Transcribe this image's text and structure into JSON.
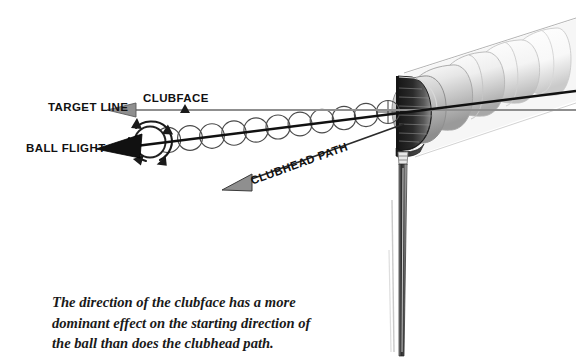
{
  "figure": {
    "background_color": "#ffffff",
    "width": 576,
    "height": 362
  },
  "labels": {
    "target_line": "TARGET LINE",
    "ball_flight": "BALL FLIGHT",
    "clubface": "CLUBFACE",
    "clubhead_path": "CLUBHEAD PATH"
  },
  "caption": {
    "line1": "The direction of the clubface has a more",
    "line2": "dominant effect on the starting direction of",
    "line3": "the ball than does the clubhead path."
  },
  "colors": {
    "ink": "#111111",
    "gray_arrow": "#8a8a8a",
    "gray_arrow_outline": "#4d4d4d",
    "ball_outline": "#3a3a3a",
    "club_dark": "#1c1c1c",
    "club_mid": "#6e6e6e",
    "club_light": "#d8d8d8",
    "shaft": "#2a2a2a",
    "background": "#ffffff"
  },
  "diagram_elements": {
    "target_line_arrow": "gray leftward arrow along the horizontal target line",
    "ball_flight_arrow": "black leftward arrow angled slightly up, showing actual ball flight",
    "clubhead_path_arrow": "gray arrow angled down-left from the clubhead, showing swing path",
    "ball_trail": "row of overlapping circles showing the ball travelling away from impact",
    "spin_arrows": "curved arrows circling the ball indicating sidespin",
    "club_head": "driver head shown at impact with motion-blur ghost images trailing up-right",
    "club_shaft": "club shaft descending below the clubhead",
    "impact_ball": "ball with crosshair pressed against the clubface"
  }
}
